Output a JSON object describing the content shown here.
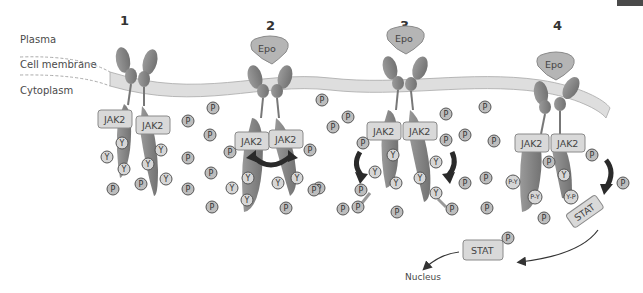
{
  "labels": {
    "plasma": "Plasma",
    "membrane": "Cell membrane",
    "cytoplasm": "Cytoplasm",
    "nucleus": "Nucleus"
  },
  "steps": [
    "1",
    "2",
    "3",
    "4"
  ],
  "molecules": {
    "epo": "Epo",
    "jak2": "JAK2",
    "stat": "STAT",
    "phosphate": "P",
    "tyrosine": "Y",
    "phospho_tyrosine": "P-Y",
    "tyrosine_phosphate": "Y-P"
  },
  "colors": {
    "receptor": "#8c8c8c",
    "receptor_dark": "#6e6e6e",
    "membrane": "#dcdcdc",
    "membrane_edge": "#a8a8a8",
    "box_fill": "#d9d9d9",
    "box_edge": "#8a8a8a",
    "circle_fill": "#c4c4c4",
    "circle_edge": "#555555",
    "arrow": "#2a2a2a"
  }
}
